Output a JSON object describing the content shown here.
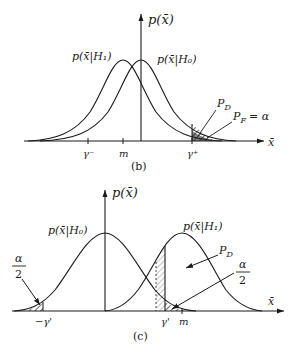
{
  "panel_b": {
    "caption": "(b)",
    "y_axis_label": "p(x̄)",
    "x_axis_label": "x̄",
    "curve_h1_label": "p(x̄|H₁)",
    "curve_h0_label": "p(x̄|H₀)",
    "tick_gamma_minus": "γ⁻",
    "tick_m": "m",
    "tick_gamma_plus": "γ⁺",
    "annot_pd": "P",
    "annot_pd_sub": "D",
    "annot_pf": "P",
    "annot_pf_sub": "F",
    "annot_pf_eq": "= α"
  },
  "panel_c": {
    "caption": "(c)",
    "y_axis_label": "p(x̄)",
    "x_axis_label": "x̄",
    "curve_h0_label": "p(x̄|H₀)",
    "curve_h1_label": "p(x̄|H₁)",
    "tick_neg_gamma": "−γ'",
    "tick_gamma": "γ'",
    "tick_m": "m",
    "annot_pd": "P",
    "annot_pd_sub": "D",
    "annot_alpha_num": "α",
    "annot_alpha_den": "2",
    "annot_alpha_left_num": "α",
    "annot_alpha_left_den": "2"
  }
}
